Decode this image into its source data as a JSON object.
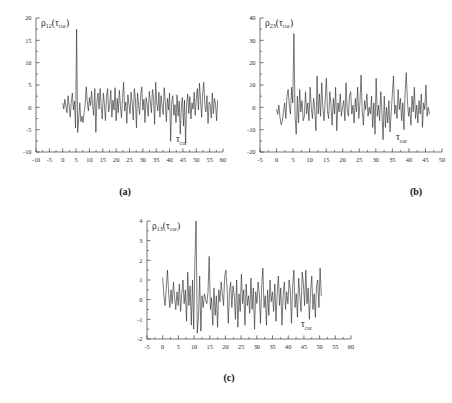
{
  "figure": {
    "background": "#ffffff",
    "trace_color": "#2a2a2a",
    "axis_color": "#3a3a3a"
  },
  "panels": [
    {
      "id": "a",
      "caption": "(a)",
      "ylabel_rho": "ρ",
      "ylabel_sub": "12",
      "ylabel_arg_open": "(",
      "ylabel_tau": "τ",
      "ylabel_tau_sub": "cor",
      "ylabel_arg_close": ")",
      "xlabel_tau": "τ",
      "xlabel_sub": "cor",
      "xticks": [
        -10,
        -5,
        0,
        5,
        10,
        15,
        20,
        25,
        30,
        35,
        40,
        45,
        50,
        55,
        60
      ],
      "yticks": [
        -10,
        -5,
        0,
        5,
        10,
        15,
        20
      ],
      "xlim": [
        -10,
        60
      ],
      "ylim": [
        -10,
        20
      ]
    },
    {
      "id": "b",
      "caption": "(b)",
      "ylabel_rho": "ρ",
      "ylabel_sub": "23",
      "ylabel_arg_open": "(",
      "ylabel_tau": "τ",
      "ylabel_tau_sub": "cor",
      "ylabel_arg_close": ")",
      "xlabel_tau": "τ",
      "xlabel_sub": "cor",
      "xticks": [
        -5,
        0,
        5,
        10,
        15,
        20,
        25,
        30,
        35,
        40,
        45,
        50
      ],
      "yticks": [
        -20,
        -10,
        0,
        10,
        20,
        30,
        40
      ],
      "xlim": [
        -5,
        50
      ],
      "ylim": [
        -20,
        40
      ]
    },
    {
      "id": "c",
      "caption": "(c)",
      "ylabel_rho": "ρ",
      "ylabel_sub": "13",
      "ylabel_arg_open": "(",
      "ylabel_tau": "τ",
      "ylabel_tau_sub": "cor",
      "ylabel_arg_close": ")",
      "xlabel_tau": "τ",
      "xlabel_sub": "cor",
      "xticks": [
        -5,
        0,
        5,
        10,
        15,
        20,
        25,
        30,
        35,
        40,
        45,
        50,
        55,
        60
      ],
      "yticks": [
        -2,
        -1,
        0,
        1,
        2,
        3,
        4
      ],
      "xlim": [
        -5,
        60
      ],
      "ylim": [
        -2,
        4
      ]
    }
  ],
  "chart_data": [
    {
      "type": "line",
      "panel": "a",
      "title": "",
      "xlabel": "τ_cor",
      "ylabel": "ρ_12(τ_cor)",
      "xlim": [
        -10,
        60
      ],
      "ylim": [
        -10,
        20
      ],
      "grid": false,
      "legend": "none",
      "xtick_labels": [
        "-10",
        "-5",
        "0",
        "5",
        "10",
        "15",
        "20",
        "25",
        "30",
        "35",
        "40",
        "45",
        "50",
        "55",
        "60"
      ],
      "ytick_labels": [
        "-10",
        "-5",
        "0",
        "5",
        "10",
        "15",
        "20"
      ],
      "peak": {
        "x": 5.2,
        "y": 17.5
      },
      "x": [
        0.0,
        0.4,
        0.8,
        1.2,
        1.6,
        2.0,
        2.4,
        2.8,
        3.2,
        3.6,
        4.0,
        4.4,
        4.8,
        5.2,
        5.6,
        6.0,
        6.4,
        6.8,
        7.2,
        7.6,
        8.0,
        8.4,
        8.8,
        9.2,
        9.6,
        10.0,
        10.4,
        10.8,
        11.2,
        11.6,
        12.0,
        12.4,
        12.8,
        13.2,
        13.6,
        14.0,
        14.4,
        14.8,
        15.2,
        15.6,
        16.0,
        16.4,
        16.8,
        17.2,
        17.6,
        18.0,
        18.4,
        18.8,
        19.2,
        19.6,
        20.0,
        20.4,
        20.8,
        21.2,
        21.6,
        22.0,
        22.4,
        22.8,
        23.2,
        23.6,
        24.0,
        24.4,
        24.8,
        25.2,
        25.6,
        26.0,
        26.4,
        26.8,
        27.2,
        27.6,
        28.0,
        28.4,
        28.8,
        29.2,
        29.6,
        30.0,
        30.4,
        30.8,
        31.2,
        31.6,
        32.0,
        32.4,
        32.8,
        33.2,
        33.6,
        34.0,
        34.4,
        34.8,
        35.2,
        35.6,
        36.0,
        36.4,
        36.8,
        37.2,
        37.6,
        38.0,
        38.4,
        38.8,
        39.2,
        39.6,
        40.0,
        40.4,
        40.8,
        41.2,
        41.6,
        42.0,
        42.4,
        42.8,
        43.2,
        43.6,
        44.0,
        44.4,
        44.8,
        45.2,
        45.6,
        46.0,
        46.4,
        46.8,
        47.2,
        47.6,
        48.0,
        48.4,
        48.8,
        49.2,
        49.6,
        50.0,
        50.4,
        50.8,
        51.2,
        51.6,
        52.0,
        52.4,
        52.8,
        53.2,
        53.6,
        54.0,
        54.4,
        54.8,
        55.2,
        55.6,
        56.0,
        56.4,
        56.8,
        57.2,
        57.6,
        58.0,
        58.4,
        58.8,
        59.2,
        59.6
      ],
      "y": [
        0.9,
        -0.4,
        1.8,
        0.2,
        -1.2,
        2.6,
        0.4,
        -2.2,
        1.1,
        3.2,
        -0.6,
        1.4,
        -4.6,
        17.5,
        -5.6,
        -2.4,
        1.0,
        -3.2,
        -2.0,
        -3.4,
        -1.2,
        0.6,
        4.6,
        1.2,
        -0.8,
        2.2,
        0.4,
        3.6,
        0.2,
        -1.8,
        4.2,
        -5.6,
        1.4,
        3.2,
        -0.4,
        4.2,
        0.2,
        -2.6,
        3.2,
        0.8,
        -3.0,
        2.4,
        4.2,
        -1.0,
        0.6,
        3.8,
        -2.2,
        1.6,
        -0.6,
        4.4,
        -3.0,
        2.0,
        -1.2,
        3.8,
        0.4,
        -2.4,
        2.2,
        5.6,
        -0.8,
        1.2,
        -3.6,
        2.8,
        0.6,
        -1.4,
        3.4,
        1.0,
        -2.8,
        4.2,
        2.0,
        -4.6,
        3.2,
        0.4,
        -1.6,
        2.8,
        4.6,
        -0.6,
        1.8,
        -3.4,
        2.2,
        0.8,
        -2.0,
        3.6,
        1.4,
        -1.2,
        4.0,
        2.2,
        -3.8,
        5.6,
        1.0,
        -0.8,
        3.4,
        -2.2,
        2.6,
        0.4,
        -1.6,
        4.4,
        1.2,
        -3.2,
        2.0,
        -0.6,
        3.2,
        -7.6,
        1.0,
        2.6,
        -1.8,
        0.6,
        -3.4,
        2.8,
        -2.0,
        1.4,
        -6.0,
        0.2,
        2.2,
        -4.2,
        1.6,
        -8.0,
        0.8,
        3.0,
        -1.4,
        2.4,
        -2.6,
        1.0,
        -0.4,
        3.4,
        -1.8,
        2.0,
        4.2,
        -0.6,
        5.4,
        1.6,
        -2.2,
        3.0,
        5.6,
        0.4,
        -1.0,
        2.6,
        -3.6,
        1.2,
        0.6,
        -2.4,
        3.2,
        -1.4,
        2.0,
        0.8,
        -3.0,
        1.6
      ]
    },
    {
      "type": "line",
      "panel": "b",
      "title": "",
      "xlabel": "τ_cor",
      "ylabel": "ρ_23(τ_cor)",
      "xlim": [
        -5,
        50
      ],
      "ylim": [
        -20,
        40
      ],
      "grid": false,
      "legend": "none",
      "xtick_labels": [
        "-5",
        "0",
        "5",
        "10",
        "15",
        "20",
        "25",
        "30",
        "35",
        "40",
        "45",
        "50"
      ],
      "ytick_labels": [
        "-20",
        "-10",
        "0",
        "10",
        "20",
        "30",
        "40"
      ],
      "peak": {
        "x": 5.0,
        "y": 33.0
      },
      "x": [
        0.0,
        0.35,
        0.7,
        1.05,
        1.4,
        1.75,
        2.1,
        2.45,
        2.8,
        3.15,
        3.5,
        3.85,
        4.2,
        4.55,
        4.9,
        5.25,
        5.6,
        5.95,
        6.3,
        6.65,
        7.0,
        7.35,
        7.7,
        8.05,
        8.4,
        8.75,
        9.1,
        9.45,
        9.8,
        10.15,
        10.5,
        10.85,
        11.2,
        11.55,
        11.9,
        12.25,
        12.6,
        12.95,
        13.3,
        13.65,
        14.0,
        14.35,
        14.7,
        15.05,
        15.4,
        15.75,
        16.1,
        16.45,
        16.8,
        17.15,
        17.5,
        17.85,
        18.2,
        18.55,
        18.9,
        19.25,
        19.6,
        19.95,
        20.3,
        20.65,
        21.0,
        21.35,
        21.7,
        22.05,
        22.4,
        22.75,
        23.1,
        23.45,
        23.8,
        24.15,
        24.5,
        24.85,
        25.2,
        25.55,
        25.9,
        26.25,
        26.6,
        26.95,
        27.3,
        27.65,
        28.0,
        28.35,
        28.7,
        29.05,
        29.4,
        29.75,
        30.1,
        30.45,
        30.8,
        31.15,
        31.5,
        31.85,
        32.2,
        32.55,
        32.9,
        33.25,
        33.6,
        33.95,
        34.3,
        34.65,
        35.0,
        35.35,
        35.7,
        36.05,
        36.4,
        36.75,
        37.1,
        37.45,
        37.8,
        38.15,
        38.5,
        38.85,
        39.2,
        39.55,
        39.9,
        40.25,
        40.6,
        40.95,
        41.3,
        41.65,
        42.0,
        42.35,
        42.7,
        43.05,
        43.4,
        43.75,
        44.1,
        44.45,
        44.8,
        45.15,
        45.5,
        45.85,
        46.2
      ],
      "y": [
        -1.0,
        -3.2,
        1.0,
        -4.6,
        -7.8,
        -6.0,
        -2.0,
        2.0,
        -5.0,
        5.0,
        8.0,
        1.0,
        -3.0,
        9.0,
        2.0,
        33.0,
        -4.0,
        -12.0,
        5.0,
        -7.0,
        8.0,
        -2.0,
        3.0,
        -6.0,
        -4.0,
        7.0,
        -3.0,
        2.0,
        -6.0,
        9.0,
        0.0,
        -5.0,
        4.0,
        -1.0,
        -10.5,
        14.0,
        -3.0,
        6.0,
        -4.0,
        11.0,
        0.0,
        -6.0,
        3.0,
        13.0,
        -2.0,
        -5.0,
        7.0,
        1.0,
        -8.0,
        4.0,
        -3.0,
        9.0,
        -10.5,
        2.0,
        -2.0,
        6.0,
        -4.0,
        0.0,
        3.0,
        -6.0,
        11.0,
        -1.0,
        -4.0,
        5.0,
        7.0,
        -3.0,
        1.0,
        -7.0,
        4.0,
        -2.0,
        9.0,
        -5.0,
        2.0,
        14.5,
        -2.0,
        -8.0,
        3.0,
        -1.0,
        6.0,
        -4.0,
        0.0,
        -3.0,
        5.0,
        -9.0,
        2.0,
        -12.0,
        13.0,
        -4.0,
        1.0,
        -6.0,
        7.0,
        -2.0,
        -14.5,
        5.0,
        -9.0,
        0.0,
        -7.0,
        3.0,
        -11.0,
        -2.0,
        6.0,
        14.0,
        -3.0,
        1.0,
        -5.0,
        8.0,
        -1.0,
        4.0,
        -6.0,
        2.0,
        -10.0,
        7.0,
        15.5,
        3.0,
        -4.0,
        0.0,
        -8.0,
        5.0,
        -2.0,
        9.0,
        -5.0,
        1.0,
        -7.0,
        3.0,
        -3.0,
        6.0,
        -9.0,
        2.0,
        -1.0,
        10.0,
        -4.0,
        0.0,
        -3.0
      ]
    },
    {
      "type": "line",
      "panel": "c",
      "title": "",
      "xlabel": "τ_cor",
      "ylabel": "ρ_13(τ_cor)",
      "xlim": [
        -5,
        60
      ],
      "ylim": [
        -2,
        4
      ],
      "grid": false,
      "legend": "none",
      "xtick_labels": [
        "-5",
        "0",
        "5",
        "10",
        "15",
        "20",
        "25",
        "30",
        "35",
        "40",
        "45",
        "50",
        "55",
        "60"
      ],
      "ytick_labels": [
        "-2",
        "-1",
        "0",
        "1",
        "2",
        "3",
        "4"
      ],
      "peak": {
        "x": 10.6,
        "y": 4.0
      },
      "x": [
        0.0,
        0.38,
        0.76,
        1.14,
        1.52,
        1.9,
        2.28,
        2.66,
        3.04,
        3.42,
        3.8,
        4.18,
        4.56,
        4.94,
        5.32,
        5.7,
        6.08,
        6.46,
        6.84,
        7.22,
        7.6,
        7.98,
        8.36,
        8.74,
        9.12,
        9.5,
        9.88,
        10.26,
        10.64,
        11.02,
        11.4,
        11.78,
        12.16,
        12.54,
        12.92,
        13.3,
        13.68,
        14.06,
        14.44,
        14.82,
        15.2,
        15.58,
        15.96,
        16.34,
        16.72,
        17.1,
        17.48,
        17.86,
        18.24,
        18.62,
        19.0,
        19.38,
        19.76,
        20.14,
        20.52,
        20.9,
        21.28,
        21.66,
        22.04,
        22.42,
        22.8,
        23.18,
        23.56,
        23.94,
        24.32,
        24.7,
        25.08,
        25.46,
        25.84,
        26.22,
        26.6,
        26.98,
        27.36,
        27.74,
        28.12,
        28.5,
        28.88,
        29.26,
        29.64,
        30.02,
        30.4,
        30.78,
        31.16,
        31.54,
        31.92,
        32.3,
        32.68,
        33.06,
        33.44,
        33.82,
        34.2,
        34.58,
        34.96,
        35.34,
        35.72,
        36.1,
        36.48,
        36.86,
        37.24,
        37.62,
        38.0,
        38.38,
        38.76,
        39.14,
        39.52,
        39.9,
        40.28,
        40.66,
        41.04,
        41.42,
        41.8,
        42.18,
        42.56,
        42.94,
        43.32,
        43.7,
        44.08,
        44.46,
        44.84,
        45.22,
        45.6,
        45.98,
        46.36,
        46.74,
        47.12,
        47.5,
        47.88,
        48.26,
        48.64,
        49.02,
        49.4,
        49.78,
        50.16,
        50.54,
        50.92,
        51.3
      ],
      "y": [
        1.1,
        0.2,
        -0.3,
        0.6,
        1.5,
        0.3,
        -0.4,
        0.5,
        -0.2,
        0.9,
        0.1,
        -0.5,
        0.4,
        -0.3,
        0.8,
        -0.6,
        0.3,
        1.0,
        -0.2,
        0.5,
        -1.1,
        1.4,
        -0.3,
        0.7,
        -1.3,
        1.0,
        -1.5,
        2.0,
        4.0,
        -1.7,
        -0.9,
        1.2,
        -1.6,
        0.2,
        -0.4,
        0.3,
        0.0,
        -0.2,
        0.4,
        2.2,
        -0.5,
        0.1,
        -1.3,
        0.6,
        -0.8,
        0.2,
        -1.4,
        0.5,
        -0.1,
        0.9,
        0.3,
        -0.3,
        1.2,
        1.5,
        0.6,
        -1.2,
        0.4,
        0.9,
        -0.4,
        0.7,
        0.2,
        -1.0,
        1.0,
        -1.4,
        0.3,
        -0.6,
        1.3,
        -0.2,
        0.5,
        -1.3,
        0.8,
        -0.3,
        0.2,
        -0.7,
        1.1,
        -0.5,
        0.6,
        -1.5,
        0.4,
        -0.2,
        0.9,
        0.3,
        -1.2,
        0.7,
        1.6,
        -0.4,
        0.2,
        -1.3,
        0.5,
        -0.8,
        1.0,
        -0.1,
        0.4,
        -0.6,
        0.8,
        -1.1,
        0.3,
        1.2,
        -0.3,
        0.6,
        -1.3,
        0.2,
        0.9,
        -0.5,
        0.4,
        -0.2,
        1.0,
        0.5,
        -1.2,
        0.7,
        1.5,
        -0.4,
        0.3,
        -0.9,
        1.1,
        0.2,
        -0.6,
        1.4,
        0.8,
        -0.3,
        1.5,
        -0.2,
        0.6,
        -1.0,
        0.4,
        1.2,
        -0.5,
        0.3,
        -0.9,
        0.7,
        1.0,
        -0.4,
        1.6,
        0.2
      ]
    }
  ]
}
